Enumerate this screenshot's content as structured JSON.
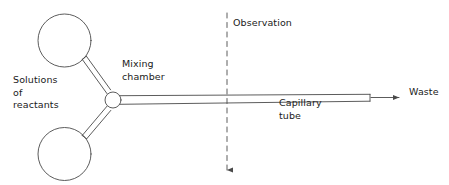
{
  "figure": {
    "background_color": "#ffffff",
    "line_color": "#4a4a4a",
    "text_color": "#1a1a1a"
  },
  "labels": {
    "solutions_of_reactants": "Solutions\nof\nreactants",
    "mixing_chamber": "Mixing\nchamber",
    "observation": "Observation",
    "capillary_tube": "Capillary\ntube",
    "waste": "Waste"
  },
  "components": {
    "upper_reservoir": {
      "name": "upper-reactant-bulb",
      "cx": 64.5,
      "cy": 40.5,
      "r": 26.5
    },
    "lower_reservoir": {
      "name": "lower-reactant-bulb",
      "cx": 64.5,
      "cy": 154.0,
      "r": 26.5
    },
    "mixing_chamber": {
      "name": "mixing-chamber",
      "cx": 113,
      "cy": 100,
      "r": 8
    },
    "capillary_tube": {
      "name": "capillary-tube",
      "x_start": 121,
      "x_end": 370,
      "y_top": 94,
      "y_bottom": 101
    },
    "observation_line": {
      "name": "observation-marker",
      "x": 227,
      "y_start": 13,
      "y_end": 173,
      "style": "dashed",
      "arrow": "down"
    },
    "waste_arrow": {
      "name": "waste-arrow",
      "x_start": 371,
      "x_end": 403,
      "y": 97,
      "arrow": "right"
    }
  }
}
